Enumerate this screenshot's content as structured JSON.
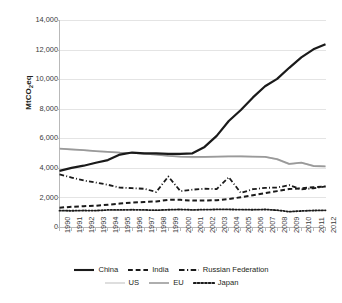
{
  "chart_data": {
    "type": "line",
    "title": "",
    "xlabel": "",
    "ylabel": "MtCO2eq",
    "ylabel_prefix": "MtCO",
    "ylabel_sub": "2",
    "ylabel_suffix": "eq",
    "ylim": [
      0,
      14000
    ],
    "ytick_step": 2000,
    "grid": true,
    "legend_position": "bottom",
    "yticks": [
      "14,000",
      "12,000",
      "10,000",
      "8,000",
      "6,000",
      "4,000",
      "2,000",
      "0"
    ],
    "ytick_values": [
      14000,
      12000,
      10000,
      8000,
      6000,
      4000,
      2000,
      0
    ],
    "categories": [
      1990,
      1991,
      1992,
      1993,
      1994,
      1995,
      1996,
      1997,
      1998,
      1999,
      2000,
      2001,
      2002,
      2003,
      2004,
      2005,
      2006,
      2007,
      2008,
      2009,
      2010,
      2011,
      2012
    ],
    "xticks": [
      "1990",
      "1991",
      "1992",
      "1993",
      "1994",
      "1995",
      "1996",
      "1997",
      "1998",
      "1999",
      "2000",
      "2001",
      "2002",
      "2003",
      "2004",
      "2005",
      "2006",
      "2007",
      "2008",
      "2009",
      "2010",
      "2011",
      "2012"
    ],
    "series": [
      {
        "name": "China",
        "color": "#1a1a1a",
        "dash": "none",
        "width": 2.2,
        "values": [
          3830,
          4030,
          4180,
          4380,
          4560,
          4930,
          5070,
          5020,
          5020,
          4980,
          4980,
          5020,
          5450,
          6200,
          7200,
          7950,
          8800,
          9550,
          10050,
          10800,
          11500,
          12050,
          12400
        ]
      },
      {
        "name": "India",
        "color": "#1a1a1a",
        "dash": "dashed",
        "width": 2.0,
        "values": [
          1340,
          1400,
          1440,
          1470,
          1540,
          1620,
          1680,
          1730,
          1760,
          1870,
          1870,
          1820,
          1830,
          1850,
          1920,
          2050,
          2180,
          2320,
          2460,
          2600,
          2650,
          2720,
          2780
        ]
      },
      {
        "name": "Russian Federation",
        "color": "#1a1a1a",
        "dash": "dashdot",
        "width": 1.8,
        "values": [
          3590,
          3380,
          3180,
          3040,
          2890,
          2700,
          2660,
          2620,
          2400,
          3450,
          2460,
          2560,
          2620,
          2600,
          3400,
          2340,
          2590,
          2680,
          2700,
          2870,
          2580,
          2650,
          2780
        ]
      },
      {
        "name": "US",
        "color": "#d6d6d6",
        "dash": "none",
        "width": 1.6,
        "values": [
          5330,
          5270,
          5220,
          5160,
          5120,
          5070,
          5040,
          4990,
          4930,
          4860,
          4780,
          4740,
          4760,
          4790,
          4800,
          4810,
          4790,
          4780,
          4600,
          4280,
          4380,
          4150,
          4130
        ]
      },
      {
        "name": "EU",
        "color": "#9a9a9a",
        "dash": "none",
        "width": 1.8,
        "values": [
          5330,
          5280,
          5230,
          5170,
          5120,
          5070,
          5050,
          4990,
          4930,
          4850,
          4800,
          4780,
          4770,
          4790,
          4810,
          4810,
          4800,
          4770,
          4620,
          4300,
          4390,
          4160,
          4140
        ]
      },
      {
        "name": "Japan",
        "color": "#1a1a1a",
        "dash": "dotted",
        "width": 1.8,
        "values": [
          1140,
          1130,
          1150,
          1140,
          1190,
          1190,
          1200,
          1190,
          1170,
          1200,
          1220,
          1190,
          1210,
          1220,
          1220,
          1210,
          1200,
          1220,
          1170,
          1070,
          1120,
          1150,
          1160
        ]
      }
    ],
    "legend": [
      [
        {
          "label": "China",
          "style": "solid",
          "color": "#1a1a1a",
          "thick": true
        },
        {
          "label": "India",
          "style": "dashed",
          "color": "#1a1a1a",
          "thick": true
        },
        {
          "label": "Russian Federation",
          "style": "dashdot",
          "color": "#1a1a1a",
          "thick": true
        }
      ],
      [
        {
          "label": "US",
          "style": "solid",
          "color": "#d6d6d6",
          "thick": false
        },
        {
          "label": "EU",
          "style": "solid",
          "color": "#9a9a9a",
          "thick": false
        },
        {
          "label": "Japan",
          "style": "dotted",
          "color": "#1a1a1a",
          "thick": true
        }
      ]
    ]
  }
}
